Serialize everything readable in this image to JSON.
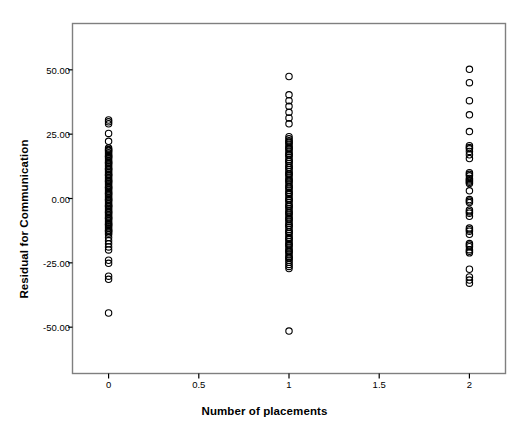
{
  "chart_data": {
    "type": "scatter",
    "title": "",
    "xlabel": "Number of placements",
    "ylabel": "Residual for Communication",
    "xlim": [
      -0.2,
      2.2
    ],
    "ylim": [
      -68,
      68
    ],
    "xticks": [
      0,
      0.5,
      1,
      1.5,
      2
    ],
    "xtick_labels": [
      "0",
      "0.5",
      "1",
      "1.5",
      "2"
    ],
    "yticks": [
      50,
      25,
      0,
      -25,
      -50
    ],
    "ytick_labels": [
      "50.00",
      "25.00",
      "0.00",
      "-25.00",
      "-50.00"
    ],
    "grid": false,
    "legend": null,
    "marker": {
      "shape": "open-circle",
      "size_px": 6.4,
      "stroke": "#000000",
      "stroke_width": 1.1,
      "fill": "none"
    },
    "frame_color": "#7f7f7f",
    "background": "#ffffff",
    "series": [
      {
        "name": "Residuals by number of placements",
        "points": [
          [
            0,
            30.5
          ],
          [
            0,
            29.8
          ],
          [
            0,
            29.0
          ],
          [
            0,
            25.3
          ],
          [
            0,
            22.2
          ],
          [
            0,
            19.6
          ],
          [
            0,
            19.0
          ],
          [
            0,
            18.4
          ],
          [
            0,
            17.8
          ],
          [
            0,
            17.2
          ],
          [
            0,
            16.6
          ],
          [
            0,
            16.0
          ],
          [
            0,
            15.4
          ],
          [
            0,
            14.8
          ],
          [
            0,
            14.2
          ],
          [
            0,
            13.6
          ],
          [
            0,
            13.0
          ],
          [
            0,
            12.4
          ],
          [
            0,
            11.8
          ],
          [
            0,
            11.2
          ],
          [
            0,
            10.6
          ],
          [
            0,
            10.0
          ],
          [
            0,
            9.4
          ],
          [
            0,
            8.8
          ],
          [
            0,
            8.2
          ],
          [
            0,
            7.6
          ],
          [
            0,
            7.0
          ],
          [
            0,
            6.4
          ],
          [
            0,
            5.8
          ],
          [
            0,
            5.2
          ],
          [
            0,
            4.6
          ],
          [
            0,
            4.0
          ],
          [
            0,
            3.4
          ],
          [
            0,
            2.8
          ],
          [
            0,
            2.2
          ],
          [
            0,
            1.6
          ],
          [
            0,
            1.0
          ],
          [
            0,
            0.4
          ],
          [
            0,
            -0.2
          ],
          [
            0,
            -0.8
          ],
          [
            0,
            -1.4
          ],
          [
            0,
            -2.0
          ],
          [
            0,
            -2.6
          ],
          [
            0,
            -3.2
          ],
          [
            0,
            -3.8
          ],
          [
            0,
            -4.4
          ],
          [
            0,
            -5.0
          ],
          [
            0,
            -5.6
          ],
          [
            0,
            -6.2
          ],
          [
            0,
            -6.8
          ],
          [
            0,
            -7.4
          ],
          [
            0,
            -8.0
          ],
          [
            0,
            -8.6
          ],
          [
            0,
            -9.2
          ],
          [
            0,
            -9.8
          ],
          [
            0,
            -10.4
          ],
          [
            0,
            -11.0
          ],
          [
            0,
            -11.6
          ],
          [
            0,
            -12.2
          ],
          [
            0,
            -12.8
          ],
          [
            0,
            -13.4
          ],
          [
            0,
            -14.0
          ],
          [
            0,
            -15.2
          ],
          [
            0,
            -16.4
          ],
          [
            0,
            -17.6
          ],
          [
            0,
            -18.8
          ],
          [
            0,
            -20.0
          ],
          [
            0,
            -24.0
          ],
          [
            0,
            -25.2
          ],
          [
            0,
            -30.2
          ],
          [
            0,
            -31.4
          ],
          [
            0,
            -44.5
          ],
          [
            0,
            18.7
          ],
          [
            0,
            16.3
          ],
          [
            0,
            13.9
          ],
          [
            0,
            11.5
          ],
          [
            0,
            9.1
          ],
          [
            0,
            6.7
          ],
          [
            0,
            4.3
          ],
          [
            0,
            1.9
          ],
          [
            0,
            -0.5
          ],
          [
            0,
            -2.9
          ],
          [
            0,
            -5.3
          ],
          [
            0,
            -7.7
          ],
          [
            0,
            -10.1
          ],
          [
            0,
            -12.5
          ],
          [
            1,
            47.4
          ],
          [
            1,
            40.3
          ],
          [
            1,
            38.0
          ],
          [
            1,
            35.8
          ],
          [
            1,
            33.5
          ],
          [
            1,
            31.3
          ],
          [
            1,
            29.0
          ],
          [
            1,
            24.0
          ],
          [
            1,
            23.2
          ],
          [
            1,
            22.4
          ],
          [
            1,
            21.6
          ],
          [
            1,
            20.8
          ],
          [
            1,
            20.0
          ],
          [
            1,
            19.2
          ],
          [
            1,
            18.4
          ],
          [
            1,
            17.6
          ],
          [
            1,
            16.8
          ],
          [
            1,
            16.0
          ],
          [
            1,
            15.2
          ],
          [
            1,
            14.4
          ],
          [
            1,
            13.6
          ],
          [
            1,
            12.8
          ],
          [
            1,
            12.0
          ],
          [
            1,
            11.2
          ],
          [
            1,
            10.4
          ],
          [
            1,
            9.6
          ],
          [
            1,
            8.8
          ],
          [
            1,
            8.0
          ],
          [
            1,
            7.2
          ],
          [
            1,
            6.4
          ],
          [
            1,
            5.6
          ],
          [
            1,
            4.8
          ],
          [
            1,
            4.0
          ],
          [
            1,
            3.2
          ],
          [
            1,
            2.4
          ],
          [
            1,
            1.6
          ],
          [
            1,
            0.8
          ],
          [
            1,
            0.0
          ],
          [
            1,
            -0.8
          ],
          [
            1,
            -1.6
          ],
          [
            1,
            -2.4
          ],
          [
            1,
            -3.2
          ],
          [
            1,
            -4.0
          ],
          [
            1,
            -4.8
          ],
          [
            1,
            -5.6
          ],
          [
            1,
            -6.4
          ],
          [
            1,
            -7.2
          ],
          [
            1,
            -8.0
          ],
          [
            1,
            -8.8
          ],
          [
            1,
            -9.6
          ],
          [
            1,
            -10.4
          ],
          [
            1,
            -11.2
          ],
          [
            1,
            -12.0
          ],
          [
            1,
            -12.8
          ],
          [
            1,
            -13.6
          ],
          [
            1,
            -14.4
          ],
          [
            1,
            -15.2
          ],
          [
            1,
            -16.0
          ],
          [
            1,
            -16.8
          ],
          [
            1,
            -17.6
          ],
          [
            1,
            -18.4
          ],
          [
            1,
            -19.2
          ],
          [
            1,
            -20.0
          ],
          [
            1,
            -20.8
          ],
          [
            1,
            -21.6
          ],
          [
            1,
            -22.4
          ],
          [
            1,
            -23.2
          ],
          [
            1,
            -24.0
          ],
          [
            1,
            -24.8
          ],
          [
            1,
            -25.6
          ],
          [
            1,
            -26.4
          ],
          [
            1,
            -27.2
          ],
          [
            1,
            -51.5
          ],
          [
            1,
            22.0
          ],
          [
            1,
            19.5
          ],
          [
            1,
            17.0
          ],
          [
            1,
            14.5
          ],
          [
            1,
            12.0
          ],
          [
            1,
            9.5
          ],
          [
            1,
            7.0
          ],
          [
            1,
            4.5
          ],
          [
            1,
            2.0
          ],
          [
            1,
            -0.5
          ],
          [
            1,
            -3.0
          ],
          [
            1,
            -5.5
          ],
          [
            1,
            -8.0
          ],
          [
            1,
            -10.5
          ],
          [
            1,
            -13.0
          ],
          [
            1,
            -15.5
          ],
          [
            1,
            -18.0
          ],
          [
            1,
            -20.5
          ],
          [
            1,
            -23.0
          ],
          [
            2,
            50.2
          ],
          [
            2,
            45.0
          ],
          [
            2,
            38.0
          ],
          [
            2,
            32.5
          ],
          [
            2,
            26.0
          ],
          [
            2,
            20.5
          ],
          [
            2,
            19.3
          ],
          [
            2,
            18.3
          ],
          [
            2,
            15.5
          ],
          [
            2,
            10.0
          ],
          [
            2,
            8.8
          ],
          [
            2,
            7.8
          ],
          [
            2,
            6.8
          ],
          [
            2,
            5.8
          ],
          [
            2,
            3.0
          ],
          [
            2,
            -0.4
          ],
          [
            2,
            -1.6
          ],
          [
            2,
            -4.5
          ],
          [
            2,
            -5.7
          ],
          [
            2,
            -6.9
          ],
          [
            2,
            -11.5
          ],
          [
            2,
            -12.7
          ],
          [
            2,
            -13.9
          ],
          [
            2,
            -17.5
          ],
          [
            2,
            -18.7
          ],
          [
            2,
            -19.9
          ],
          [
            2,
            -21.1
          ],
          [
            2,
            -27.5
          ],
          [
            2,
            -30.5
          ],
          [
            2,
            -31.7
          ],
          [
            2,
            -32.9
          ],
          [
            2,
            19.8
          ],
          [
            2,
            17.0
          ],
          [
            2,
            9.4
          ],
          [
            2,
            7.3
          ],
          [
            2,
            6.3
          ],
          [
            2,
            -1.0
          ],
          [
            2,
            -5.1
          ],
          [
            2,
            -12.1
          ],
          [
            2,
            -18.1
          ],
          [
            2,
            -20.5
          ]
        ]
      }
    ]
  }
}
